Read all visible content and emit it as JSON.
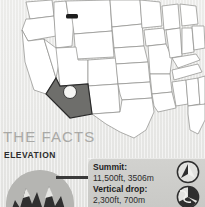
{
  "map": {
    "name": "united-states-map",
    "background_color": "#e9e9e7",
    "state_fill": "#ffffff",
    "state_border_color": "#8d8d8a",
    "highlight_state": "Arizona",
    "highlight_fill": "#6e6e6b",
    "marker_color": "#ffffff",
    "secondary_marker_state": "Montana",
    "secondary_marker_color": "#1d1d1d"
  },
  "facts": {
    "title": "THE FACTS",
    "section_label": "ELEVATION",
    "badge_icon": "mountain-peaks-icon",
    "rows": [
      {
        "label": "Summit:",
        "value": "11,500ft, 3506m",
        "icon": "summit-arrow-icon"
      },
      {
        "label": "Vertical drop:",
        "value": "2,300ft, 700m",
        "icon": "vertical-drop-icon"
      }
    ],
    "title_color": "#a9a9a6",
    "label_color": "#1d1d1d",
    "panel_color": "#cdcdca"
  }
}
